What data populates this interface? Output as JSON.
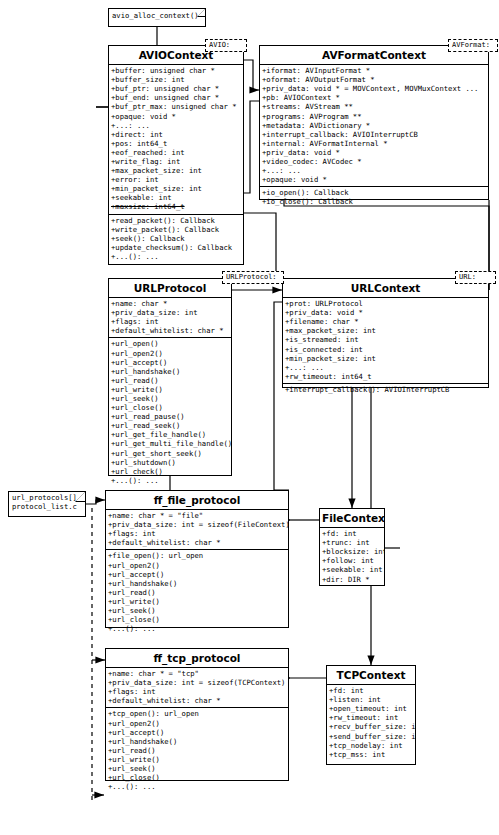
{
  "diagram": {
    "type": "uml-class-diagram",
    "background": "#ffffff",
    "line_color": "#000000"
  },
  "notes": [
    {
      "id": "note-avio-alloc",
      "name": "avio-alloc-context-note",
      "lines": [
        "avio_alloc_context()"
      ],
      "x": 108,
      "y": 8,
      "w": 98,
      "h": 19
    },
    {
      "id": "note-url-protocols",
      "name": "url-protocols-note",
      "lines": [
        "url_protocols[]",
        "protocol_list.c"
      ],
      "x": 8,
      "y": 491,
      "w": 78,
      "h": 26
    }
  ],
  "tags": [
    {
      "id": "tag-avio",
      "name": "avio-package-tag",
      "label": "AVIO:",
      "x": 205,
      "y": 39,
      "w": 42,
      "h": 13
    },
    {
      "id": "tag-avformat",
      "name": "avformat-package-tag",
      "label": "AVFormat:",
      "x": 448,
      "y": 39,
      "w": 50,
      "h": 13
    },
    {
      "id": "tag-urlprotocol",
      "name": "urlprotocol-package-tag",
      "label": "URLProtocol:",
      "x": 222,
      "y": 271,
      "w": 62,
      "h": 13
    },
    {
      "id": "tag-url",
      "name": "url-package-tag",
      "label": "URL:",
      "x": 455,
      "y": 271,
      "w": 41,
      "h": 13
    }
  ],
  "classes": [
    {
      "id": "AVIOContext",
      "name": "class-aviocontext",
      "title": "AVIOContext",
      "x": 108,
      "y": 45,
      "w": 136,
      "h": 220,
      "compartments": [
        {
          "name": "attributes",
          "rows": [
            {
              "text": "+buffer: unsigned char *"
            },
            {
              "text": "+buffer_size: int"
            },
            {
              "text": "+buf_ptr: unsigned char *"
            },
            {
              "text": "+buf_end: unsigned char *"
            },
            {
              "text": "+buf_ptr_max: unsigned char *"
            },
            {
              "text": "+opaque: void *"
            },
            {
              "text": "+...: ..."
            },
            {
              "text": "+direct: int"
            },
            {
              "text": "+pos: int64_t"
            },
            {
              "text": "+eof_reached: int"
            },
            {
              "text": "+write_flag: int"
            },
            {
              "text": "+max_packet_size: int"
            },
            {
              "text": "+error: int"
            },
            {
              "text": "+min_packet_size: int"
            },
            {
              "text": "+seekable: int"
            },
            {
              "text": "+maxsize: int64_t",
              "strike": true
            }
          ]
        },
        {
          "name": "operations",
          "rows": [
            {
              "text": "+read_packet(): Callback"
            },
            {
              "text": "+write_packet(): Callback"
            },
            {
              "text": "+seek(): Callback"
            },
            {
              "text": "+update_checksum(): Callback"
            },
            {
              "text": "+...(): ..."
            }
          ]
        }
      ]
    },
    {
      "id": "AVFormatContext",
      "name": "class-avformatcontext",
      "title": "AVFormatContext",
      "x": 259,
      "y": 45,
      "w": 230,
      "h": 155,
      "compartments": [
        {
          "name": "attributes",
          "rows": [
            {
              "text": "+iformat: AVInputFormat *"
            },
            {
              "text": "+oformat: AVOutputFormat *"
            },
            {
              "text": "+priv_data: void * = MOVContext, MOVMuxContext  ..."
            },
            {
              "text": "+pb: AVIOContext *"
            },
            {
              "text": "+streams: AVStream **"
            },
            {
              "text": "+programs: AVProgram **"
            },
            {
              "text": "+metadata: AVDictionary *"
            },
            {
              "text": "+interrupt_callback: AVIOInterruptCB"
            },
            {
              "text": "+internal: AVFormatInternal  *"
            },
            {
              "text": "+priv_data: void *"
            },
            {
              "text": "+video_codec: AVCodec *"
            },
            {
              "text": "+...: ..."
            },
            {
              "text": "+opaque: void *"
            }
          ]
        },
        {
          "name": "operations",
          "rows": [
            {
              "text": "+io_open(): Callback"
            },
            {
              "text": "+io_close(): Callback"
            }
          ]
        }
      ]
    },
    {
      "id": "URLProtocol",
      "name": "class-urlprotocol",
      "title": "URLProtocol",
      "x": 108,
      "y": 278,
      "w": 124,
      "h": 198,
      "compartments": [
        {
          "name": "attributes",
          "rows": [
            {
              "text": "+name: char *"
            },
            {
              "text": "+priv_data_size: int"
            },
            {
              "text": "+flags: int"
            },
            {
              "text": "+default_whitelist: char *"
            }
          ]
        },
        {
          "name": "operations",
          "rows": [
            {
              "text": "+url_open()"
            },
            {
              "text": "+url_open2()"
            },
            {
              "text": "+url_accept()"
            },
            {
              "text": "+url_handshake()"
            },
            {
              "text": "+url_read()"
            },
            {
              "text": "+url_write()"
            },
            {
              "text": "+url_seek()"
            },
            {
              "text": "+url_close()"
            },
            {
              "text": "+url_read_pause()"
            },
            {
              "text": "+url_read_seek()"
            },
            {
              "text": "+url_get_file_handle()"
            },
            {
              "text": "+url_get_multi_file_handle()"
            },
            {
              "text": "+url_get_short_seek()"
            },
            {
              "text": "+url_shutdown()"
            },
            {
              "text": "+url_check()"
            },
            {
              "text": "+...(): ..."
            }
          ]
        }
      ]
    },
    {
      "id": "URLContext",
      "name": "class-urlcontext",
      "title": "URLContext",
      "x": 282,
      "y": 278,
      "w": 207,
      "h": 110,
      "compartments": [
        {
          "name": "attributes",
          "rows": [
            {
              "text": "+prot: URLProtocol"
            },
            {
              "text": "+priv_data: void *"
            },
            {
              "text": "+filename: char *"
            },
            {
              "text": "+max_packet_size: int"
            },
            {
              "text": "+is_streamed: int"
            },
            {
              "text": "+is_connected: int"
            },
            {
              "text": "+min_packet_size: int"
            },
            {
              "text": "+...: ..."
            },
            {
              "text": "+rw_timeout: int64_t"
            }
          ]
        },
        {
          "name": "operations",
          "rows": [
            {
              "text": "+interrupt_callback(): AVIOInterruptCB"
            }
          ]
        }
      ]
    },
    {
      "id": "ff_file_protocol",
      "name": "class-ff-file-protocol",
      "title": "ff_file_protocol",
      "x": 105,
      "y": 490,
      "w": 184,
      "h": 138,
      "compartments": [
        {
          "name": "attributes",
          "rows": [
            {
              "text": "+name: char * = \"file\""
            },
            {
              "text": "+priv_data_size: int = sizeof(FileContext)"
            },
            {
              "text": "+flags: int"
            },
            {
              "text": "+default_whitelist: char *"
            }
          ]
        },
        {
          "name": "operations",
          "rows": [
            {
              "text": "+file_open(): url_open"
            },
            {
              "text": "+url_open2()"
            },
            {
              "text": "+url_accept()"
            },
            {
              "text": "+url_handshake()"
            },
            {
              "text": "+url_read()"
            },
            {
              "text": "+url_write()"
            },
            {
              "text": "+url_seek()"
            },
            {
              "text": "+url_close()"
            },
            {
              "text": "+...(): ..."
            }
          ]
        }
      ]
    },
    {
      "id": "FileContext",
      "name": "class-filecontext",
      "title": "FileContext",
      "x": 319,
      "y": 508,
      "w": 66,
      "h": 78,
      "compartments": [
        {
          "name": "attributes",
          "rows": [
            {
              "text": "+fd: int"
            },
            {
              "text": "+trunc: int"
            },
            {
              "text": "+blocksize: int"
            },
            {
              "text": "+follow: int"
            },
            {
              "text": "+seekable: int"
            },
            {
              "text": "+dir: DIR *"
            }
          ]
        }
      ]
    },
    {
      "id": "ff_tcp_protocol",
      "name": "class-ff-tcp-protocol",
      "title": "ff_tcp_protocol",
      "x": 105,
      "y": 648,
      "w": 184,
      "h": 133,
      "compartments": [
        {
          "name": "attributes",
          "rows": [
            {
              "text": "+name: char * = \"tcp\""
            },
            {
              "text": "+priv_data_size: int = sizeof(TCPContext)"
            },
            {
              "text": "+flags: int"
            },
            {
              "text": "+default_whitelist: char *"
            }
          ]
        },
        {
          "name": "operations",
          "rows": [
            {
              "text": "+tcp_open(): url_open"
            },
            {
              "text": "+url_open2()"
            },
            {
              "text": "+url_accept()"
            },
            {
              "text": "+url_handshake()"
            },
            {
              "text": "+url_read()"
            },
            {
              "text": "+url_write()"
            },
            {
              "text": "+url_seek()"
            },
            {
              "text": "+url_close()"
            },
            {
              "text": "+...(): ..."
            }
          ]
        }
      ]
    },
    {
      "id": "TCPContext",
      "name": "class-tcpcontext",
      "title": "TCPContext",
      "x": 326,
      "y": 665,
      "w": 90,
      "h": 100,
      "compartments": [
        {
          "name": "attributes",
          "rows": [
            {
              "text": "+fd: int"
            },
            {
              "text": "+listen: int"
            },
            {
              "text": "+open_timeout: int"
            },
            {
              "text": "+rw_timeout: int"
            },
            {
              "text": "+recv_buffer_size: int"
            },
            {
              "text": "+send_buffer_size: int"
            },
            {
              "text": "+tcp_nodelay: int"
            },
            {
              "text": "+tcp_mss: int"
            }
          ]
        }
      ]
    }
  ]
}
